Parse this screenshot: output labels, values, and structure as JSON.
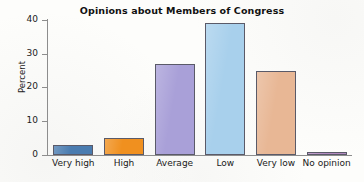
{
  "chart_data": {
    "type": "bar",
    "title": "Opinions about Members of Congress",
    "xlabel": "",
    "ylabel": "Percent",
    "categories": [
      "Very high",
      "High",
      "Average",
      "Low",
      "Very low",
      "No opinion"
    ],
    "values": [
      3,
      5,
      27,
      39,
      25,
      1
    ],
    "ylim": [
      0,
      40
    ],
    "yticks": [
      0,
      10,
      20,
      30,
      40
    ],
    "ytick_labels": [
      "0",
      "10",
      "20",
      "30",
      "40"
    ],
    "grid": false,
    "legend": false,
    "bar_colors": [
      "#4a7cb0",
      "#f0901f",
      "#a9a0d8",
      "#a8d0ec",
      "#e8b795",
      "#b38ac0"
    ],
    "bar_edge_color": "#5a5a68",
    "axis_color": "#8d8d8d",
    "background_color": "#fdfdfb",
    "text_color": "#1a1a1a"
  }
}
